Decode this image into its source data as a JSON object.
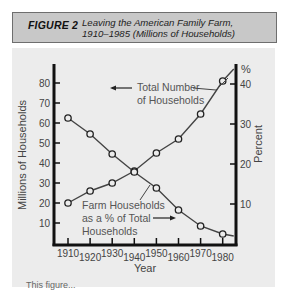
{
  "figure": {
    "label": "FIGURE 2",
    "title_line1": "Leaving the American Family Farm,",
    "title_line2": "1910–1985 (Millions of Households)"
  },
  "caption_partial": "This figure...",
  "colors": {
    "title_bar": "#c8c8c8",
    "panel_bg": "#ececec",
    "axis": "#111111",
    "line": "#444444",
    "text": "#444444"
  },
  "chart_data": {
    "type": "line",
    "title": "Leaving the American Family Farm, 1910–1985 (Millions of Households)",
    "xlabel": "Year",
    "ylabel_left": "Millions of Households",
    "ylabel_right": "Percent",
    "right_axis_unit": "%",
    "x": [
      1910,
      1920,
      1930,
      1940,
      1950,
      1960,
      1970,
      1980,
      1985
    ],
    "x_tick_labels": [
      "1910",
      "1920",
      "1930",
      "1940",
      "1950",
      "1960",
      "1970",
      "1980"
    ],
    "y_left_ticks": [
      10,
      20,
      30,
      40,
      50,
      60,
      70,
      80
    ],
    "y_right_ticks": [
      10,
      20,
      30,
      40
    ],
    "ylim_left": [
      0,
      90
    ],
    "ylim_right": [
      0,
      45
    ],
    "series": [
      {
        "name": "Total Number of Households",
        "axis": "left",
        "label_lines": [
          "Total Number",
          "of Households"
        ],
        "values": [
          20,
          26,
          30,
          36,
          45,
          52,
          64.5,
          81,
          87
        ],
        "markers": [
          true,
          true,
          true,
          true,
          true,
          true,
          true,
          true,
          false
        ]
      },
      {
        "name": "Farm Households as a % of Total Households",
        "axis": "right",
        "label_lines": [
          "Farm Households",
          "as a % of Total",
          "Households"
        ],
        "values": [
          31.5,
          27.5,
          22.5,
          18,
          14,
          8.5,
          4.5,
          2.5,
          2
        ],
        "markers": [
          true,
          true,
          true,
          true,
          true,
          true,
          true,
          true,
          false
        ]
      }
    ],
    "grid": false,
    "legend": "inline labels with arrows pointing to respective axes"
  }
}
